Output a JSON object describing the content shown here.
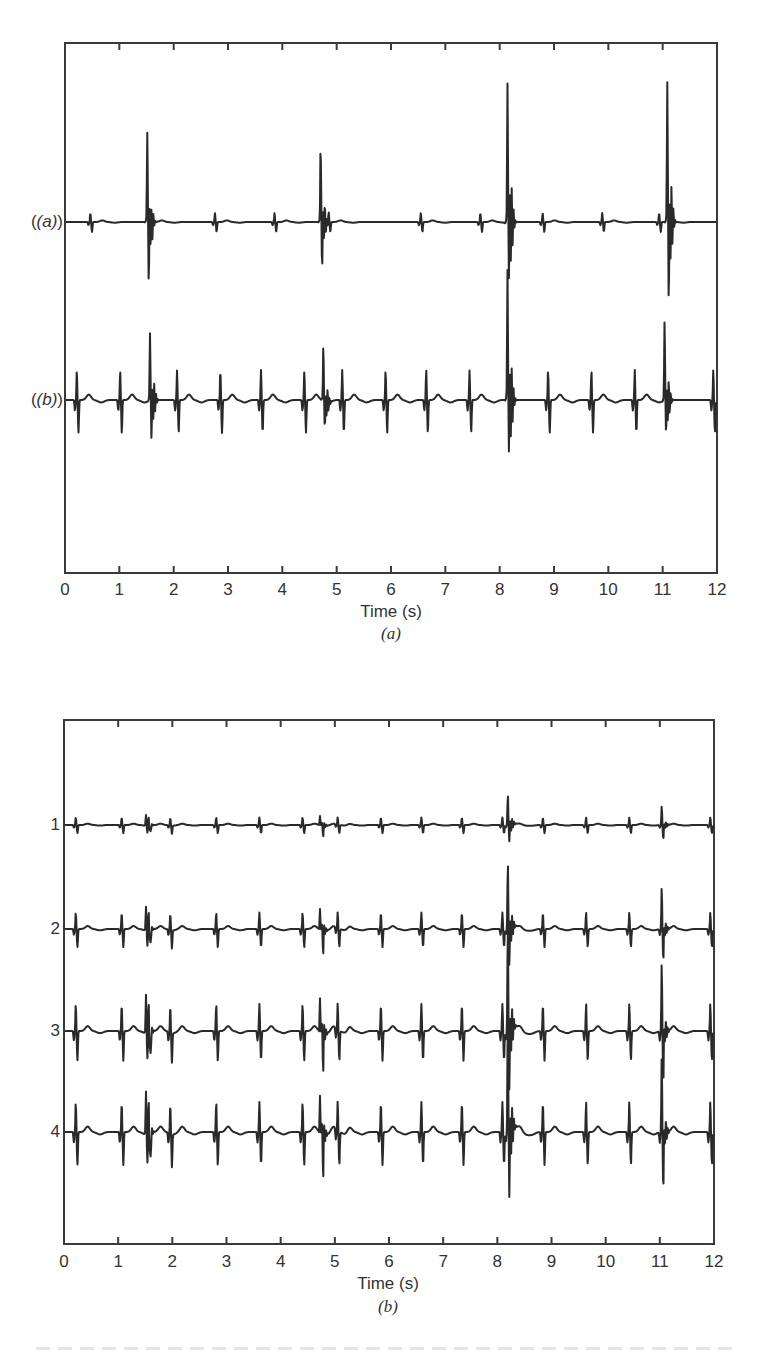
{
  "chart_data": [
    {
      "type": "line",
      "panel_label": "(a)",
      "xlabel": "Time (s)",
      "ylabel": "",
      "xlim": [
        0,
        12
      ],
      "x_ticks": [
        0,
        1,
        2,
        3,
        4,
        5,
        6,
        7,
        8,
        9,
        10,
        11,
        12
      ],
      "grid": false,
      "series": [
        {
          "name": "(a)",
          "description": "ECG-like trace with small regular beats and four large ectopic spikes",
          "normal_beats_s": [
            0.45,
            1.55,
            2.75,
            3.85,
            4.85,
            6.55,
            7.65,
            8.8,
            9.9,
            10.95
          ],
          "spikes": [
            {
              "t": 1.5,
              "up": 1.0,
              "down": 0.75
            },
            {
              "t": 4.7,
              "up": 0.85,
              "down": 0.55
            },
            {
              "t": 8.15,
              "up": 1.55,
              "down": 0.55
            },
            {
              "t": 11.1,
              "up": 1.55,
              "down": 0.95
            }
          ]
        },
        {
          "name": "(b)",
          "description": "ECG-like trace with regular large beats plus the same ectopic spikes",
          "normal_beats_s": [
            0.2,
            1.0,
            2.05,
            2.85,
            3.6,
            4.4,
            5.1,
            5.9,
            6.65,
            7.45,
            8.9,
            9.7,
            10.5,
            11.95
          ],
          "spikes": [
            {
              "t": 1.55,
              "up": 0.75,
              "down": 0.45
            },
            {
              "t": 4.75,
              "up": 0.6,
              "down": 0.3
            },
            {
              "t": 8.15,
              "up": 1.45,
              "down": 0.5
            },
            {
              "t": 11.05,
              "up": 0.9,
              "down": 0.35
            }
          ]
        }
      ]
    },
    {
      "type": "line",
      "panel_label": "(b)",
      "xlabel": "Time (s)",
      "ylabel": "",
      "xlim": [
        0,
        12
      ],
      "x_ticks": [
        0,
        1,
        2,
        3,
        4,
        5,
        6,
        7,
        8,
        9,
        10,
        11,
        12
      ],
      "grid": false,
      "series": [
        {
          "name": "1",
          "scale": 0.25
        },
        {
          "name": "2",
          "scale": 0.55
        },
        {
          "name": "3",
          "scale": 0.9
        },
        {
          "name": "4",
          "scale": 1.0
        }
      ],
      "shared_beats_s": [
        0.2,
        1.05,
        1.55,
        1.95,
        2.8,
        3.6,
        4.4,
        4.75,
        5.05,
        5.85,
        6.6,
        7.35,
        8.1,
        8.2,
        8.85,
        9.65,
        10.45,
        11.05,
        11.95
      ],
      "ectopic_s": [
        1.5,
        4.72,
        8.2,
        11.05
      ]
    }
  ],
  "panel_a": {
    "row_labels": [
      "(a)",
      "(b)"
    ],
    "tick_labels": [
      "0",
      "1",
      "2",
      "3",
      "4",
      "5",
      "6",
      "7",
      "8",
      "9",
      "10",
      "11",
      "12"
    ],
    "xlabel": "Time (s)",
    "sub_caption": "(a)"
  },
  "panel_b": {
    "row_labels": [
      "1",
      "2",
      "3",
      "4"
    ],
    "tick_labels": [
      "0",
      "1",
      "2",
      "3",
      "4",
      "5",
      "6",
      "7",
      "8",
      "9",
      "10",
      "11",
      "12"
    ],
    "xlabel": "Time (s)",
    "sub_caption": "(b)"
  }
}
